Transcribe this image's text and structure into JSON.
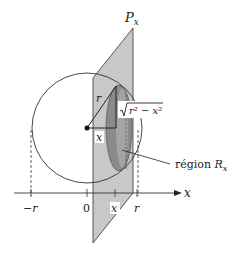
{
  "diagram": {
    "plane_label": "P",
    "plane_subscript": "x",
    "radius_label": "r",
    "sqrt_expr": "r² − x²",
    "center_x_label": "x",
    "region_label_text": "région ",
    "region_label_var": "R",
    "region_label_sub": "x",
    "axis_label": "x",
    "ticks": [
      {
        "label": "−r"
      },
      {
        "label": "0"
      },
      {
        "label": "x"
      },
      {
        "label": "r"
      }
    ]
  },
  "colors": {
    "plane_fill": "#c8c8c8",
    "region_fill": "#8a8a8a",
    "line": "#222222",
    "background": "#ffffff"
  }
}
